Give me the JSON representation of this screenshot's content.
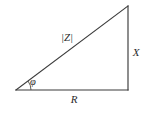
{
  "diagram": {
    "background_color": "#ffffff",
    "line_color": "#3a3a3a",
    "text_color": "#2b2b2b",
    "labels": {
      "hypotenuse": "|Z|",
      "vertical": "X",
      "horizontal": "R",
      "angle": "φ"
    },
    "geometry": {
      "origin_x": 16,
      "origin_y": 90,
      "corner_x": 128,
      "corner_y": 90,
      "apex_x": 128,
      "apex_y": 6,
      "arc_radius": 15
    },
    "label_positions": {
      "hypotenuse_x": 67,
      "hypotenuse_y": 38,
      "vertical_x": 136,
      "vertical_y": 53,
      "horizontal_x": 74,
      "horizontal_y": 100,
      "angle_x": 33,
      "angle_y": 83
    }
  }
}
